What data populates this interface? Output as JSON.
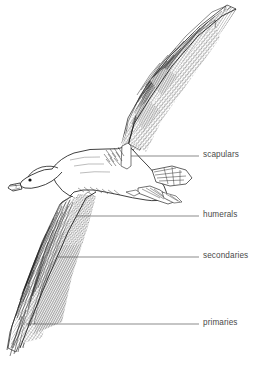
{
  "figure": {
    "kind": "line-drawing",
    "background_color": "#ffffff",
    "ink_color": "#2b2b2b",
    "label_color": "#4a4a4a",
    "width": 263,
    "height": 367
  },
  "labels": [
    {
      "id": "scapulars",
      "text": "scapulars",
      "text_x": 203,
      "text_y": 152,
      "leader_y": 156,
      "leader_x_start": 131,
      "leader_x_end": 199
    },
    {
      "id": "humerals",
      "text": "humerals",
      "text_x": 203,
      "text_y": 212,
      "leader_y": 216,
      "leader_x_start": 76,
      "leader_x_end": 199
    },
    {
      "id": "secondaries",
      "text": "secondaries",
      "text_x": 203,
      "text_y": 253,
      "leader_y": 257,
      "leader_x_start": 58,
      "leader_x_end": 199
    },
    {
      "id": "primaries",
      "text": "primaries",
      "text_x": 203,
      "text_y": 320,
      "leader_y": 324,
      "leader_x_start": 26,
      "leader_x_end": 199
    }
  ],
  "top_clipped_text": ""
}
